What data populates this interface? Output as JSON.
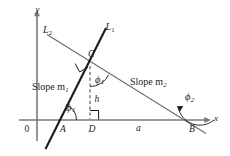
{
  "figure": {
    "background_color": "#ffffff",
    "ink_color": "#1a1a1a",
    "axis_color": "#7a7a7a",
    "line1_color": "#1a1a1a",
    "line2_color": "#6b6b6b",
    "dash_color": "#4d4d4d"
  },
  "axes": {
    "x_label": "x",
    "y_label": "y",
    "origin_label": "0"
  },
  "lines": [
    {
      "id": "L1",
      "label": "L",
      "subscript": "1",
      "slope_text": "Slope m",
      "slope_subscript": "1"
    },
    {
      "id": "L2",
      "label": "L",
      "subscript": "2",
      "slope_text": "Slope m",
      "slope_subscript": "2"
    }
  ],
  "line_labels": {
    "l1_label": "L",
    "l1_sub": "1",
    "l2_label": "L",
    "l2_sub": "2"
  },
  "slope_labels": {
    "slope_m1_text": "Slope m",
    "slope_m1_sub": "1",
    "slope_m2_text": "Slope m",
    "slope_m2_sub": "2"
  },
  "points": [
    {
      "name": "A",
      "label": "A"
    },
    {
      "name": "B",
      "label": "B"
    },
    {
      "name": "C",
      "label": "C"
    },
    {
      "name": "D",
      "label": "D"
    }
  ],
  "point_labels": {
    "A": "A",
    "B": "B",
    "C": "C",
    "D": "D"
  },
  "segments": {
    "height_label": "h",
    "base_label": "a"
  },
  "angles": [
    {
      "id": "phi1_at_A",
      "symbol": "ϕ",
      "subscript": "1",
      "vertex": "A"
    },
    {
      "id": "phi1_at_C",
      "symbol": "ϕ",
      "subscript": "1",
      "vertex": "C"
    },
    {
      "id": "phi2_at_B",
      "symbol": "ϕ",
      "subscript": "2",
      "vertex": "B"
    }
  ],
  "angle_labels": {
    "phi_symbol": "ϕ",
    "phi1_sub": "1",
    "phi2_sub": "2"
  },
  "markers": {
    "right_angle_at_C": "right-angle-square",
    "right_angle_at_D": "right-angle-square"
  }
}
